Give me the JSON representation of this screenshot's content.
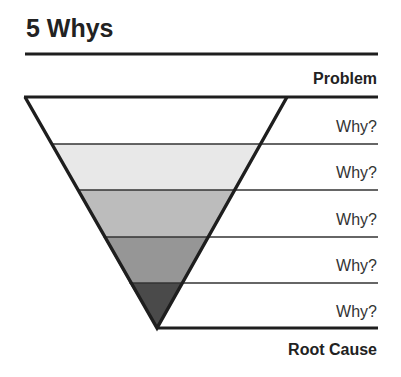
{
  "title": "5 Whys",
  "top_label": "Problem",
  "bottom_label": "Root Cause",
  "levels": [
    {
      "label": "Why?",
      "fill": "#ffffff"
    },
    {
      "label": "Why?",
      "fill": "#e8e8e8"
    },
    {
      "label": "Why?",
      "fill": "#bcbcbc"
    },
    {
      "label": "Why?",
      "fill": "#969696"
    },
    {
      "label": "Why?",
      "fill": "#4a4a4a"
    }
  ],
  "colors": {
    "line": "#1e1e1e",
    "text": "#222222"
  }
}
